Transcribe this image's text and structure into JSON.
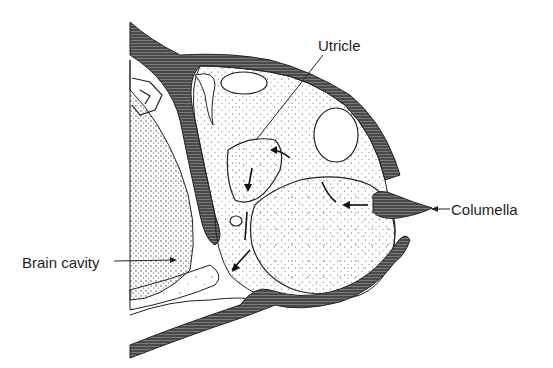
{
  "figure": {
    "labels": {
      "utricle": "Utricle",
      "columella": "Columella",
      "brain_cavity": "Brain cavity"
    },
    "colors": {
      "ink": "#1e1e1e",
      "tissue_dark": "#3a3a3a",
      "background": "#ffffff"
    }
  }
}
